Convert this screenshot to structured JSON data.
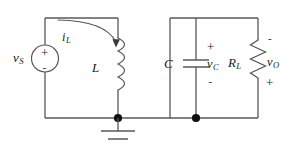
{
  "diagram": {
    "stroke_color": "#58585a",
    "text_color": "#1a1a1a",
    "background": "#ffffff"
  },
  "components": {
    "source": {
      "label": "v",
      "subscript": "S",
      "name": "voltage-source",
      "plus": "+",
      "minus": "-"
    },
    "inductor": {
      "label": "L",
      "subscript": "",
      "name": "inductor"
    },
    "current": {
      "label": "i",
      "subscript": "L",
      "name": "inductor-current"
    },
    "capacitor": {
      "label": "C",
      "subscript": "",
      "name": "capacitor",
      "voltage_label": "v",
      "voltage_subscript": "C",
      "plus": "+",
      "minus": "-"
    },
    "resistor": {
      "label": "R",
      "subscript": "L",
      "name": "load-resistor",
      "voltage_label": "v",
      "voltage_subscript": "O",
      "plus": "+",
      "minus": "-"
    },
    "ground": {
      "name": "ground-symbol"
    }
  }
}
